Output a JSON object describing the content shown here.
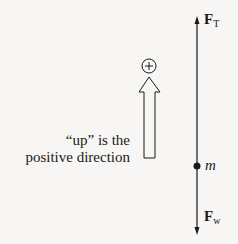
{
  "diagram": {
    "type": "free-body diagram",
    "caption_line1": "“up” is the",
    "caption_line2": "positive direction",
    "positive_sign": "+",
    "mass_label": "m",
    "forces": [
      {
        "symbol": "F",
        "subscript": "T",
        "direction": "up"
      },
      {
        "symbol": "F",
        "subscript": "w",
        "direction": "down"
      }
    ],
    "colors": {
      "background": "#f7f6f4",
      "ink": "#1a1a1a"
    }
  }
}
